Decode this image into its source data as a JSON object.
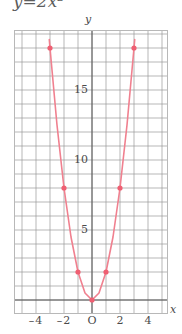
{
  "title": {
    "text": "y=2x²",
    "clipped": true
  },
  "axes": {
    "y_label": "y",
    "x_label": "x",
    "origin_label": "O"
  },
  "chart_data": {
    "type": "line",
    "title": "y=2x²",
    "subtitle": "",
    "xlabel": "x",
    "ylabel": "y",
    "xlim": [
      -5.5,
      5.5
    ],
    "ylim": [
      -1.5,
      19.0
    ],
    "grid": true,
    "grid_step_x": 1,
    "grid_step_y": 1,
    "legend": "none",
    "curve_color": "#f0808f",
    "point_color": "#ef5f72",
    "grid_color": "#6f6f6f",
    "minor_grid_color": "#c9c9c9",
    "function": "y = 2x^2",
    "x_ticks": [
      -4,
      -2,
      0,
      2,
      4
    ],
    "x_tick_labels": [
      "4",
      "2",
      "O",
      "2",
      "4"
    ],
    "x_tick_signs": [
      "-",
      "-",
      "",
      "",
      ""
    ],
    "y_ticks": [
      5,
      10,
      15
    ],
    "y_tick_labels": [
      "5",
      "10",
      "15"
    ],
    "series": [
      {
        "name": "y = 2x^2",
        "x": [
          -3.05,
          -3.0,
          -2.5,
          -2.0,
          -1.5,
          -1.0,
          -0.5,
          0.0,
          0.5,
          1.0,
          1.5,
          2.0,
          2.5,
          3.0,
          3.05
        ],
        "values": [
          18.6,
          18.0,
          12.5,
          8.0,
          4.5,
          2.0,
          0.5,
          0.0,
          0.5,
          2.0,
          4.5,
          8.0,
          12.5,
          18.0,
          18.6
        ]
      }
    ],
    "marked_points": [
      {
        "x": -3,
        "y": 18
      },
      {
        "x": -2,
        "y": 8
      },
      {
        "x": -1,
        "y": 2
      },
      {
        "x": 0,
        "y": 0
      },
      {
        "x": 1,
        "y": 2
      },
      {
        "x": 2,
        "y": 8
      },
      {
        "x": 3,
        "y": 18
      }
    ]
  }
}
